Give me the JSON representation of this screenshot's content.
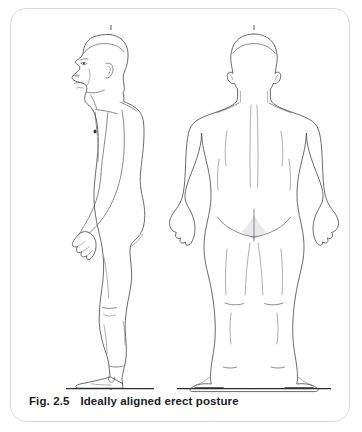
{
  "figure": {
    "caption_number": "Fig. 2.5",
    "caption_text": "Ideally aligned erect posture",
    "panel_background": "#ffffff",
    "panel_border_color": "#d8d8d8",
    "outline_color": "#4f4f52",
    "plumb_line_color": "#7d7d82",
    "ground_line_color": "#2b2b2e",
    "caption_color": "#1b1b1e",
    "views": [
      {
        "id": "lateral-view",
        "name": "lateral view",
        "label": "",
        "orientation": "side view, facing left",
        "plumb_line": "vertical dashed postural reference line"
      },
      {
        "id": "posterior-view",
        "name": "posterior view",
        "label": "",
        "orientation": "back view",
        "plumb_line": "vertical dashed midline reference"
      }
    ]
  }
}
